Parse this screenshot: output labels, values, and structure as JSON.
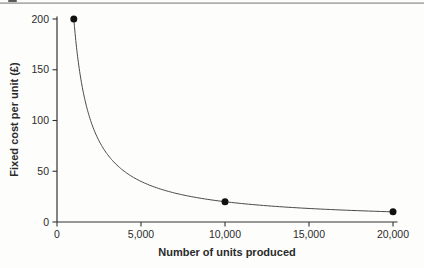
{
  "chart_data": {
    "type": "line",
    "title": "",
    "xlabel": "Number of units produced",
    "ylabel": "Fixed cost per unit (£)",
    "xlim": [
      0,
      20200
    ],
    "ylim": [
      0,
      200
    ],
    "x_ticks": [
      0,
      5000,
      10000,
      15000,
      20000
    ],
    "x_tick_labels": [
      "0",
      "5,000",
      "10,000",
      "15,000",
      "20,000"
    ],
    "y_ticks": [
      0,
      50,
      100,
      150,
      200
    ],
    "y_tick_labels": [
      "0",
      "50",
      "100",
      "150",
      "200"
    ],
    "grid": false,
    "curve": {
      "description": "fixed cost per unit = 200,000 / units produced",
      "numerator": 200000,
      "x_start": 1000,
      "x_end": 20000
    },
    "points": [
      {
        "x": 1000,
        "y": 200
      },
      {
        "x": 10000,
        "y": 20
      },
      {
        "x": 20000,
        "y": 10
      }
    ],
    "colors": {
      "axis": "#333333",
      "line": "#4a4a4a",
      "marker": "#111111",
      "text": "#2b2b2b",
      "rule": "#a6a6a6"
    }
  }
}
